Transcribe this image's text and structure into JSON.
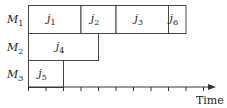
{
  "diagram": {
    "type": "gantt-schedule",
    "unit_px": 17.5,
    "origin_x": 28,
    "machines": [
      {
        "label": "M",
        "sub": "1",
        "y": 5,
        "h": 28
      },
      {
        "label": "M",
        "sub": "2",
        "y": 33,
        "h": 27
      },
      {
        "label": "M",
        "sub": "3",
        "y": 60,
        "h": 27
      }
    ],
    "jobs": [
      {
        "machine": 0,
        "label": "j",
        "sub": "1",
        "start": 0,
        "end": 3
      },
      {
        "machine": 0,
        "label": "j",
        "sub": "2",
        "start": 3,
        "end": 5
      },
      {
        "machine": 0,
        "label": "j",
        "sub": "3",
        "start": 5,
        "end": 8
      },
      {
        "machine": 0,
        "label": "j",
        "sub": "6",
        "start": 8,
        "end": 9
      },
      {
        "machine": 1,
        "label": "j",
        "sub": "4",
        "start": 0,
        "end": 4
      },
      {
        "machine": 2,
        "label": "j",
        "sub": "5",
        "start": 0,
        "end": 2
      }
    ],
    "axis": {
      "label": "Time",
      "ticks": 10
    }
  }
}
